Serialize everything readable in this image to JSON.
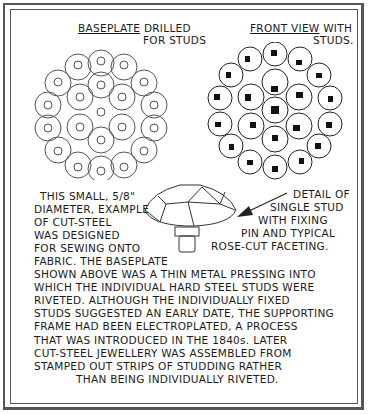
{
  "labels": {
    "baseplate_title_underlined": "BASEPLATE",
    "baseplate_title_rest": "DRILLED",
    "baseplate_title_line2": "FOR STUDS",
    "front_view_underlined": "FRONT VIEW",
    "front_view_rest": "WITH",
    "front_view_line2": "STUDS."
  },
  "left_caption": [
    "THIS SMALL, 5/8\"",
    "DIAMETER, EXAMPLE",
    "OF CUT-STEEL",
    "WAS DESIGNED",
    "FOR SEWING ONTO",
    "FABRIC. THE BASEPLATE"
  ],
  "detail_caption": [
    "DETAIL OF",
    "SINGLE STUD",
    "WITH FIXING",
    "PIN AND TYPICAL",
    "ROSE-CUT FACETING."
  ],
  "body_text": [
    "SHOWN ABOVE WAS A  THIN  METAL PRESSING INTO",
    "WHICH THE  INDIVIDUAL HARD STEEL STUDS WERE",
    "RIVETED.  ALTHOUGH THE  INDIVIDUALLY FIXED",
    "STUDS SUGGESTED AN EARLY DATE, THE SUPPORTING",
    "FRAME HAD BEEN ELECTROPLATED,  A PROCESS",
    "THAT WAS INTRODUCED IN THE  1840s.  LATER",
    "CUT-STEEL JEWELLERY WAS ASSEMBLED FROM",
    "STAMPED OUT STRIPS OF STUDDING RATHER",
    "THAN BEING  INDIVIDUALLY RIVETED."
  ]
}
